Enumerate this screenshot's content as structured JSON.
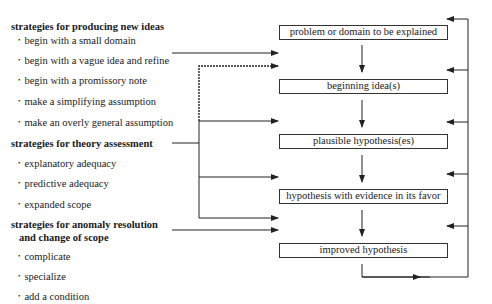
{
  "left_column": {
    "groups": [
      {
        "heading": "strategies for producing new ideas",
        "items": [
          "begin with a small domain",
          "begin with a vague idea and refine",
          "begin with a promissory note",
          "make a simplifying assumption",
          "make an overly general assumption"
        ]
      },
      {
        "heading": "strategies for theory assessment",
        "items": [
          "explanatory adequacy",
          "predictive adequacy",
          "expanded scope"
        ]
      },
      {
        "heading_line1": "strategies for anomaly resolution",
        "heading_line2": "and change of scope",
        "items": [
          "complicate",
          "specialize",
          "add a condition"
        ]
      }
    ]
  },
  "flow_boxes": [
    "problem or domain to be explained",
    "beginning idea(s)",
    "plausible hypothesis(es)",
    "hypothesis with evidence in its favor",
    "improved hypothesis"
  ],
  "colors": {
    "line": "#222222",
    "box_border": "#333333",
    "background": "#ffffff"
  }
}
